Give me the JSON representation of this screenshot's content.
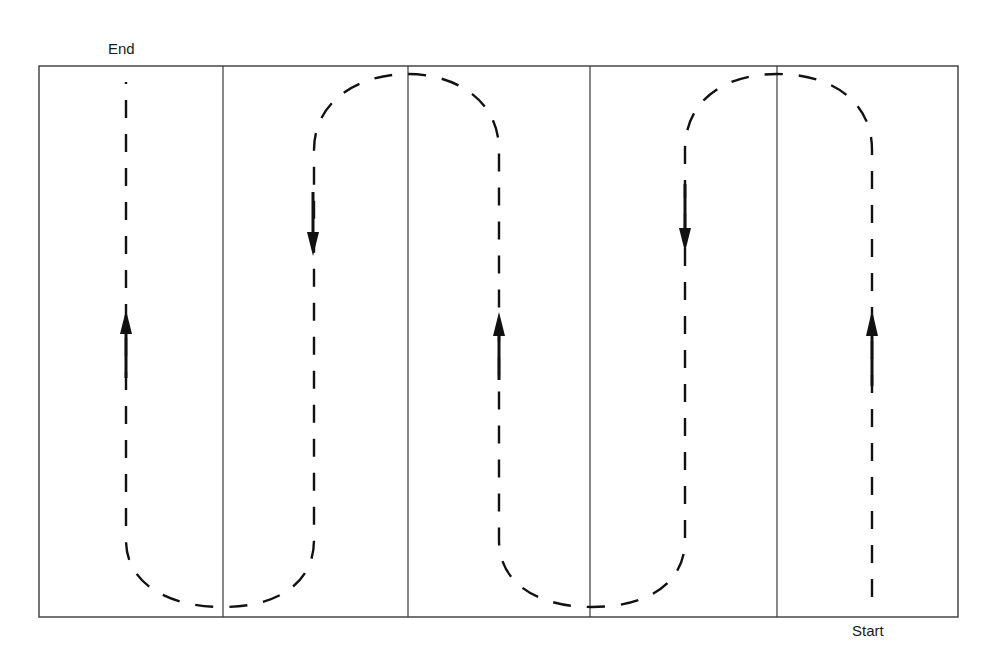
{
  "diagram": {
    "type": "serpentine-path",
    "labels": {
      "end": "End",
      "start": "Start"
    },
    "frame": {
      "x": 39,
      "y": 66,
      "width": 919,
      "height": 551,
      "color": "#3a3a3a"
    },
    "lanes": [
      {
        "index": 1,
        "x_left": 39,
        "x_right": 223,
        "path_x": 126,
        "direction": "up"
      },
      {
        "index": 2,
        "x_left": 223,
        "x_right": 408,
        "path_x": 314,
        "direction": "down"
      },
      {
        "index": 3,
        "x_left": 408,
        "x_right": 590,
        "path_x": 499,
        "direction": "up"
      },
      {
        "index": 4,
        "x_left": 590,
        "x_right": 777,
        "path_x": 685,
        "direction": "down"
      },
      {
        "index": 5,
        "x_left": 777,
        "x_right": 958,
        "path_x": 872,
        "direction": "up"
      }
    ],
    "path_style": {
      "stroke": "#111111",
      "dash": [
        18,
        16
      ]
    },
    "sequence": [
      "Start",
      "lane 5 up",
      "turn left over top",
      "lane 4 down",
      "turn left under bottom",
      "lane 3 up",
      "turn left over top",
      "lane 2 down",
      "turn left under bottom",
      "lane 1 up",
      "End"
    ]
  }
}
